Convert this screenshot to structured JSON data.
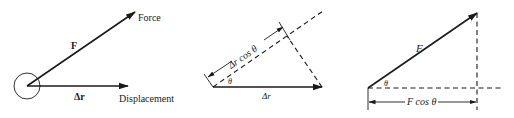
{
  "panels": [
    {
      "id": "force-displacement",
      "labels": {
        "force_vector": "F",
        "force": "Force",
        "displacement_vector": "Δr",
        "displacement": "Displacement"
      }
    },
    {
      "id": "displacement-projection",
      "labels": {
        "projection": "Δr cos θ",
        "angle": "θ",
        "displacement": "Δr"
      }
    },
    {
      "id": "force-projection",
      "labels": {
        "force": "F",
        "angle": "θ",
        "projection": "F cos θ"
      }
    }
  ],
  "colors": {
    "ink": "#1a1a1a",
    "background": "#ffffff"
  }
}
